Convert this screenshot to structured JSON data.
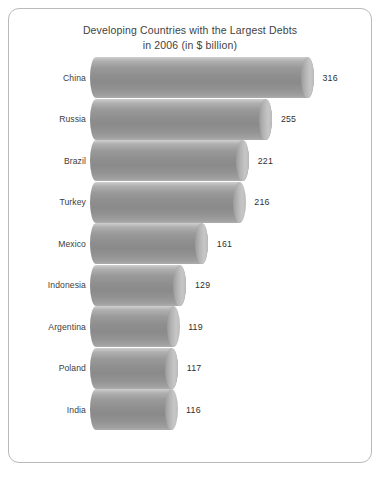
{
  "card": {
    "background": "#ffffff",
    "border_color": "#b9b9b9"
  },
  "title": {
    "line1": "Developing Countries with the Largest Debts",
    "line2": "in 2006 (in $ billion)"
  },
  "chart_data": {
    "type": "bar",
    "orientation": "horizontal",
    "title": "Developing Countries with the Largest Debts in 2006 (in $ billion)",
    "xlabel": "",
    "ylabel": "",
    "unit": "$ billion",
    "year": 2006,
    "grid": false,
    "legend": false,
    "xlim": [
      0,
      316
    ],
    "bar_style": "3d-cylinder",
    "bar_color": "#949494",
    "categories": [
      "China",
      "Russia",
      "Brazil",
      "Turkey",
      "Mexico",
      "Indonesia",
      "Argentina",
      "Poland",
      "India"
    ],
    "values": [
      316,
      255,
      221,
      216,
      161,
      129,
      119,
      117,
      116
    ],
    "value_labels": [
      "316",
      "255",
      "221",
      "216",
      "161",
      "129",
      "119",
      "117",
      "116"
    ]
  }
}
